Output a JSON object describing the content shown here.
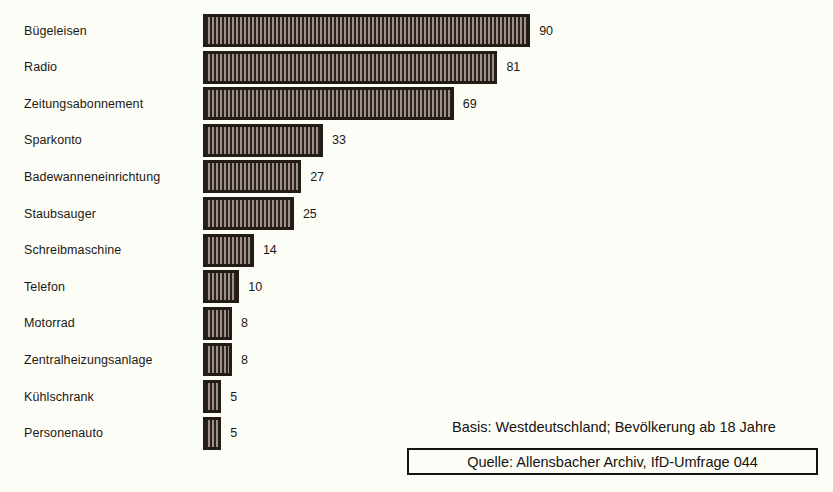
{
  "chart_data": {
    "type": "bar",
    "orientation": "horizontal",
    "title": "",
    "subtitle": "",
    "xlabel": "",
    "ylabel": "",
    "grid": false,
    "legend": null,
    "xlim": [
      0,
      90
    ],
    "categories": [
      "Bügeleisen",
      "Radio",
      "Zeitungsabonnement",
      "Sparkonto",
      "Badewanneneinrichtung",
      "Staubsauger",
      "Schreibmaschine",
      "Telefon",
      "Motorrad",
      "Zentralheizungsanlage",
      "Kühlschrank",
      "Personenauto"
    ],
    "values": [
      90,
      81,
      69,
      33,
      27,
      25,
      14,
      10,
      8,
      8,
      5,
      5
    ],
    "value_labels": [
      "90",
      "81",
      "69",
      "33",
      "27",
      "25",
      "14",
      "10",
      "8",
      "8",
      "5",
      "5"
    ],
    "annotations": [
      "Basis: Westdeutschland; Bevölkerung ab 18 Jahre",
      "Quelle: Allensbacher Archiv, IfD-Umfrage 044"
    ]
  },
  "footer": {
    "basis": "Basis: Westdeutschland; Bevölkerung ab 18 Jahre",
    "quelle": "Quelle: Allensbacher Archiv, IfD-Umfrage 044"
  },
  "colors": {
    "background": "#fdfdf7",
    "bar_fill": "#2a211b",
    "bar_hatch": "#9c9088",
    "bar_outline": "#231c16",
    "text": "#1b1814"
  }
}
